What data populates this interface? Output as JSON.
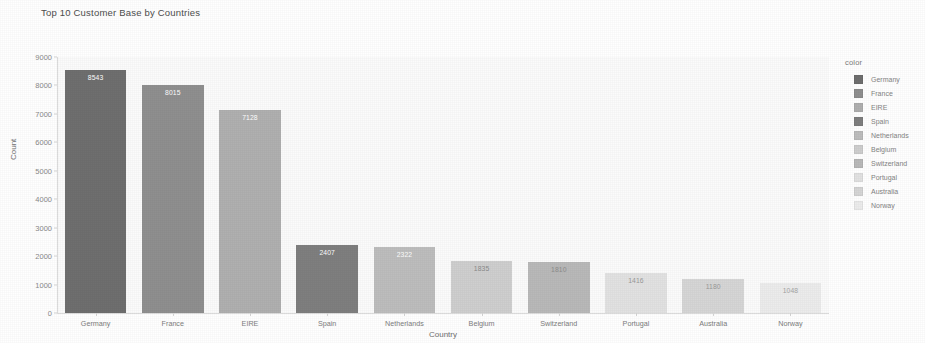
{
  "chart_data": {
    "type": "bar",
    "title": "Top 10 Customer Base by Countries",
    "xlabel": "Country",
    "ylabel": "Count",
    "categories": [
      "Germany",
      "France",
      "EIRE",
      "Spain",
      "Netherlands",
      "Belgium",
      "Switzerland",
      "Portugal",
      "Australia",
      "Norway"
    ],
    "values": [
      8543,
      8015,
      7128,
      2407,
      2322,
      1835,
      1810,
      1416,
      1180,
      1048
    ],
    "value_labels": [
      "8543",
      "8015",
      "7128",
      "2407",
      "2322",
      "1835",
      "1810",
      "1416",
      "1180",
      "1048"
    ],
    "ylim": [
      0,
      9000
    ],
    "ytick_labels": [
      "0",
      "1000",
      "2000",
      "3000",
      "4000",
      "5000",
      "6000",
      "7000",
      "8000",
      "9000"
    ],
    "ytick_values": [
      0,
      1000,
      2000,
      3000,
      4000,
      5000,
      6000,
      7000,
      8000,
      9000
    ],
    "grid": false,
    "legend_position": "right",
    "bar_colors": [
      "#6f6f6f",
      "#8f8f8f",
      "#b0b0b0",
      "#7f7f7f",
      "#bdbdbd",
      "#cfcfcf",
      "#b9b9b9",
      "#e2e2e2",
      "#d6d6d6",
      "#ececec"
    ],
    "value_label_colors": [
      "#ffffff",
      "#ffffff",
      "#ffffff",
      "#ffffff",
      "#ffffff",
      "#8c8c8c",
      "#8c8c8c",
      "#9a9a9a",
      "#9a9a9a",
      "#a5a5a5"
    ],
    "plot_background": "#fbfbfb"
  },
  "legend": {
    "title": "color",
    "items": [
      {
        "label": "Germany",
        "color": "#6f6f6f"
      },
      {
        "label": "France",
        "color": "#8f8f8f"
      },
      {
        "label": "EIRE",
        "color": "#b0b0b0"
      },
      {
        "label": "Spain",
        "color": "#7f7f7f"
      },
      {
        "label": "Netherlands",
        "color": "#bdbdbd"
      },
      {
        "label": "Belgium",
        "color": "#cfcfcf"
      },
      {
        "label": "Switzerland",
        "color": "#b9b9b9"
      },
      {
        "label": "Portugal",
        "color": "#e2e2e2"
      },
      {
        "label": "Australia",
        "color": "#d6d6d6"
      },
      {
        "label": "Norway",
        "color": "#ececec"
      }
    ]
  }
}
